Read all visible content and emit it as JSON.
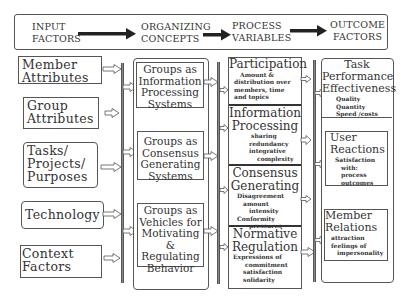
{
  "header": {
    "stages": [
      {
        "line1": "INPUT",
        "line2": "FACTORS"
      },
      {
        "line1": "ORGANIZING",
        "line2": "CONCEPTS"
      },
      {
        "line1": "PROCESS",
        "line2": "VARIABLES"
      },
      {
        "line1": "OUTCOME",
        "line2": "FACTORS"
      }
    ]
  },
  "inputs": [
    {
      "label": "Member Attributes"
    },
    {
      "label": "Group Attributes"
    },
    {
      "label": "Tasks/ Projects/ Purposes"
    },
    {
      "label": "Technology"
    },
    {
      "label": "Context Factors"
    }
  ],
  "organizing": [
    {
      "label": "Groups as Information Processing Systems"
    },
    {
      "label": "Groups as Consensus Generating Systems"
    },
    {
      "label": "Groups as Vehicles for Motivating & Regulating Behavior"
    }
  ],
  "process": [
    {
      "title": "Participation",
      "details": [
        "Amount &",
        "distribution over",
        "members, time",
        "and topics"
      ]
    },
    {
      "title": "Information Processing",
      "details": [
        "sharing",
        "redundancy",
        "integrative",
        "complexity"
      ]
    },
    {
      "title": "Consensus Generating",
      "details": [
        "Disagreement",
        "amount",
        "intensity",
        "Conformity",
        "pressures"
      ]
    },
    {
      "title": "Normative Regulation",
      "details": [
        "Expressions of",
        "commitment",
        "satisfaction",
        "solidarity"
      ]
    }
  ],
  "outcomes": [
    {
      "title": "Task Performance Effectiveness",
      "details": [
        "Quality",
        "Quantity",
        "Speed /costs"
      ]
    },
    {
      "title": "User Reactions",
      "details": [
        "Satisfaction",
        "with:",
        "process",
        "outcomes"
      ]
    },
    {
      "title": "Member Relations",
      "details": [
        "attraction",
        "feelings of",
        "impersonality"
      ]
    }
  ]
}
